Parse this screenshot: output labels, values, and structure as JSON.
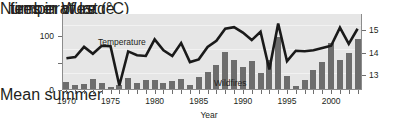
{
  "chart_data": {
    "type": "bar",
    "title": "",
    "xlabel": "Year",
    "ylabel_left": "Number of large fires in West",
    "ylabel_right": "Mean summer temperature (°C)",
    "grid": true,
    "legend_position": "in-plot",
    "x": [
      1970,
      1971,
      1972,
      1973,
      1974,
      1975,
      1976,
      1977,
      1978,
      1979,
      1980,
      1981,
      1982,
      1983,
      1984,
      1985,
      1986,
      1987,
      1988,
      1989,
      1990,
      1991,
      1992,
      1993,
      1994,
      1995,
      1996,
      1997,
      1998,
      1999,
      2000,
      2001,
      2002,
      2003
    ],
    "xlim": [
      1969.5,
      2003.5
    ],
    "xticks_labeled": [
      1970,
      1975,
      1980,
      1985,
      1990,
      1995,
      2000
    ],
    "series": [
      {
        "name": "Wildfires",
        "type": "bar",
        "axis": "left",
        "color": "#6d6d6d",
        "ylim": [
          0,
          140
        ],
        "yticks": [
          0,
          100
        ],
        "values": [
          14,
          10,
          12,
          20,
          13,
          5,
          10,
          23,
          13,
          18,
          19,
          13,
          17,
          20,
          10,
          24,
          34,
          46,
          70,
          55,
          42,
          53,
          31,
          55,
          97,
          25,
          7,
          18,
          37,
          52,
          86,
          55,
          69,
          94
        ]
      },
      {
        "name": "Temperature",
        "type": "line",
        "axis": "right",
        "color": "#1a1a1a",
        "ylim": [
          12.35,
          15.7
        ],
        "yticks": [
          13,
          14,
          15
        ],
        "values": [
          13.75,
          13.8,
          14.25,
          13.95,
          14.3,
          14.28,
          12.55,
          14.05,
          13.88,
          13.85,
          14.58,
          14.1,
          13.85,
          14.42,
          13.58,
          13.7,
          14.25,
          14.52,
          15.05,
          15.12,
          14.88,
          14.55,
          14.92,
          13.25,
          15.28,
          13.62,
          14.08,
          14.06,
          14.1,
          14.2,
          14.3,
          15.1,
          14.38,
          15.05
        ]
      }
    ],
    "annotations": [
      {
        "text": "Temperature",
        "x": 1980.5,
        "y": 15.4
      },
      {
        "text": "Wildfires",
        "x": 1993.0,
        "y": 13.1
      }
    ]
  },
  "axes": {
    "left_title_line1": "Number of large",
    "left_title_line2": "fires in West",
    "right_title_line1": "Mean summer",
    "right_title_line2": "temperature (°C)",
    "x_title": "Year",
    "left_ticks": [
      "100",
      "0"
    ],
    "right_ticks": [
      "15",
      "14",
      "13"
    ],
    "x_tick_labels": [
      "1970",
      "1975",
      "1980",
      "1985",
      "1990",
      "1995",
      "2000"
    ]
  }
}
